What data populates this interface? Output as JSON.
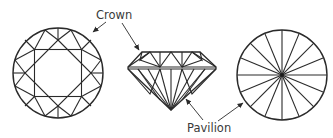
{
  "diagram": {
    "labels": {
      "crown": "Crown",
      "pavilion": "Pavilion"
    },
    "views": [
      {
        "name": "top-view",
        "description": "Crown facets seen from above"
      },
      {
        "name": "side-view",
        "description": "Profile with crown and pavilion"
      },
      {
        "name": "bottom-view",
        "description": "Pavilion facets seen from below"
      }
    ],
    "colors": {
      "line": "#2a2a2a",
      "text": "#3a3a3a",
      "background": "#ffffff"
    }
  }
}
